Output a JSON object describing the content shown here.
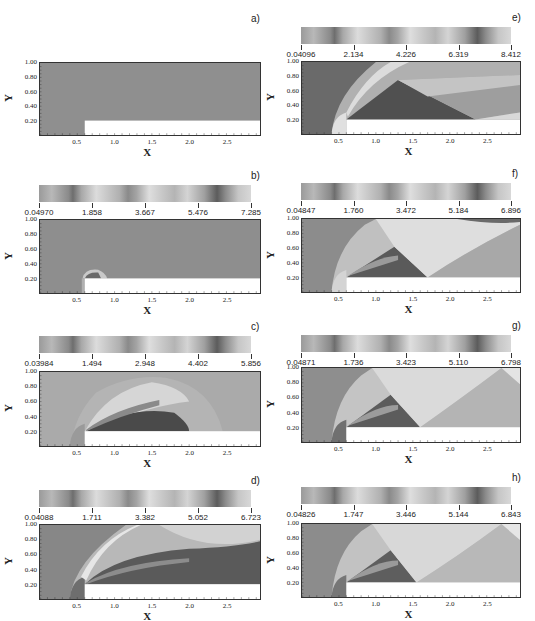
{
  "figure": {
    "panels": [
      {
        "id": "a",
        "label": "a)",
        "has_colorbar": false,
        "colorbar": null,
        "plot": {
          "left": 39,
          "top": 62,
          "width": 222,
          "height": 74
        },
        "label_pos": {
          "left": 251,
          "top": 13
        }
      },
      {
        "id": "b",
        "label": "b)",
        "has_colorbar": true,
        "colorbar": {
          "left": 39,
          "top": 185,
          "width": 212,
          "labels": [
            "0.04970",
            "1.858",
            "3.667",
            "5.476",
            "7.285"
          ]
        },
        "plot": {
          "left": 39,
          "top": 219,
          "width": 222,
          "height": 75
        },
        "label_pos": {
          "left": 251,
          "top": 170
        }
      },
      {
        "id": "c",
        "label": "c)",
        "has_colorbar": true,
        "colorbar": {
          "left": 39,
          "top": 336,
          "width": 212,
          "labels": [
            "0.03984",
            "1.494",
            "2.948",
            "4.402",
            "5.856"
          ]
        },
        "plot": {
          "left": 39,
          "top": 371,
          "width": 222,
          "height": 76
        },
        "label_pos": {
          "left": 251,
          "top": 321
        }
      },
      {
        "id": "d",
        "label": "d)",
        "has_colorbar": true,
        "colorbar": {
          "left": 39,
          "top": 490,
          "width": 212,
          "labels": [
            "0.04088",
            "1.711",
            "3.382",
            "5.052",
            "6.723"
          ]
        },
        "plot": {
          "left": 39,
          "top": 524,
          "width": 222,
          "height": 76
        },
        "label_pos": {
          "left": 251,
          "top": 475
        }
      },
      {
        "id": "e",
        "label": "e)",
        "has_colorbar": true,
        "colorbar": {
          "left": 301,
          "top": 27,
          "width": 210,
          "labels": [
            "0.04096",
            "2.134",
            "4.226",
            "6.319",
            "8.412"
          ]
        },
        "plot": {
          "left": 301,
          "top": 61,
          "width": 220,
          "height": 74
        },
        "label_pos": {
          "left": 512,
          "top": 12
        }
      },
      {
        "id": "f",
        "label": "f)",
        "has_colorbar": true,
        "colorbar": {
          "left": 301,
          "top": 183,
          "width": 210,
          "labels": [
            "0.04847",
            "1.760",
            "3.472",
            "5.184",
            "6.896"
          ]
        },
        "plot": {
          "left": 301,
          "top": 218,
          "width": 220,
          "height": 75
        },
        "label_pos": {
          "left": 512,
          "top": 168
        }
      },
      {
        "id": "g",
        "label": "g)",
        "has_colorbar": true,
        "colorbar": {
          "left": 301,
          "top": 335,
          "width": 210,
          "labels": [
            "0.04871",
            "1.736",
            "3.423",
            "5.110",
            "6.798"
          ]
        },
        "plot": {
          "left": 301,
          "top": 367,
          "width": 220,
          "height": 76
        },
        "label_pos": {
          "left": 512,
          "top": 320
        }
      },
      {
        "id": "h",
        "label": "h)",
        "has_colorbar": true,
        "colorbar": {
          "left": 301,
          "top": 487,
          "width": 210,
          "labels": [
            "0.04826",
            "1.747",
            "3.446",
            "5.144",
            "6.843"
          ]
        },
        "plot": {
          "left": 301,
          "top": 523,
          "width": 220,
          "height": 75
        },
        "label_pos": {
          "left": 512,
          "top": 472
        }
      }
    ],
    "axes": {
      "xlabel": "X",
      "ylabel": "Y",
      "xticks": [
        "0.5",
        "1.0",
        "1.5",
        "2.0",
        "2.5"
      ],
      "xtick_values": [
        0.5,
        1.0,
        1.5,
        2.0,
        2.5
      ],
      "yticks": [
        "0.20",
        "0.40",
        "0.60",
        "0.80",
        "1.00"
      ],
      "ytick_values": [
        0.2,
        0.4,
        0.6,
        0.8,
        1.0
      ],
      "xlim": [
        0.0,
        2.95
      ],
      "ylim": [
        0.0,
        1.0
      ]
    },
    "step": {
      "x": 0.6,
      "y": 0.2
    },
    "colors": {
      "background": "#ffffff",
      "field_gray": "#8c8c8c",
      "dark": "#4a4a4a",
      "light": "#e6e6e6",
      "frame": "#333333"
    }
  },
  "chart_data": [
    {
      "type": "heatmap",
      "title": "a)",
      "xlabel": "X",
      "ylabel": "Y",
      "xlim": [
        0,
        2.95
      ],
      "ylim": [
        0,
        1
      ],
      "colorbar": null,
      "description": "Uniform initial field; forward-facing step occupies x>0.6, y<0.2"
    },
    {
      "type": "heatmap",
      "title": "b)",
      "xlabel": "X",
      "ylabel": "Y",
      "xlim": [
        0,
        2.95
      ],
      "ylim": [
        0,
        1
      ],
      "colorbar": {
        "min": 0.0497,
        "max": 7.285,
        "ticks": [
          0.0497,
          1.858,
          3.667,
          5.476,
          7.285
        ]
      },
      "description": "Small bow shock forming near step corner x~0.6-0.9, y<0.3"
    },
    {
      "type": "heatmap",
      "title": "c)",
      "xlabel": "X",
      "ylabel": "Y",
      "xlim": [
        0,
        2.95
      ],
      "ylim": [
        0,
        1
      ],
      "colorbar": {
        "min": 0.03984,
        "max": 5.856,
        "ticks": [
          0.03984,
          1.494,
          2.948,
          4.402,
          5.856
        ]
      },
      "description": "Bow shock arcs from x~0.45 up to y~0.93 at x~1.5, dense region over step to x~2.0"
    },
    {
      "type": "heatmap",
      "title": "d)",
      "xlabel": "X",
      "ylabel": "Y",
      "xlim": [
        0,
        2.95
      ],
      "ylim": [
        0,
        1
      ],
      "colorbar": {
        "min": 0.04088,
        "max": 6.723,
        "ticks": [
          0.04088,
          1.711,
          3.382,
          5.052,
          6.723
        ]
      },
      "description": "Shock reaches top wall near x~1.2, reflected front along upper right, expansion fan at corner"
    },
    {
      "type": "heatmap",
      "title": "e)",
      "xlabel": "X",
      "ylabel": "Y",
      "xlim": [
        0,
        2.95
      ],
      "ylim": [
        0,
        1
      ],
      "colorbar": {
        "min": 0.04096,
        "max": 8.412,
        "ticks": [
          0.04096,
          2.134,
          4.226,
          6.319,
          8.412
        ]
      },
      "description": "Bow shock standoff x~0.4; reflected shock hits step surface near x~2.35"
    },
    {
      "type": "heatmap",
      "title": "f)",
      "xlabel": "X",
      "ylabel": "Y",
      "xlim": [
        0,
        2.95
      ],
      "ylim": [
        0,
        1
      ],
      "colorbar": {
        "min": 0.04847,
        "max": 6.896,
        "ticks": [
          0.04847,
          1.76,
          3.472,
          5.184,
          6.896
        ]
      },
      "description": "Mach stem near top wall x~0.85; reflected shock meets step near x~1.7"
    },
    {
      "type": "heatmap",
      "title": "g)",
      "xlabel": "X",
      "ylabel": "Y",
      "xlim": [
        0,
        2.95
      ],
      "ylim": [
        0,
        1
      ],
      "colorbar": {
        "min": 0.04871,
        "max": 6.798,
        "ticks": [
          0.04871,
          1.736,
          3.423,
          5.11,
          6.798
        ]
      },
      "description": "Quasi-steady pattern; reflection on step near x~1.6, second reflection off top wall x~2.7"
    },
    {
      "type": "heatmap",
      "title": "h)",
      "xlabel": "X",
      "ylabel": "Y",
      "xlim": [
        0,
        2.95
      ],
      "ylim": [
        0,
        1
      ],
      "colorbar": {
        "min": 0.04826,
        "max": 6.843,
        "ticks": [
          0.04826,
          1.747,
          3.446,
          5.144,
          6.843
        ]
      },
      "description": "Quasi-steady pattern; reflection on step near x~1.55, top-wall reflection near x~2.7"
    }
  ]
}
